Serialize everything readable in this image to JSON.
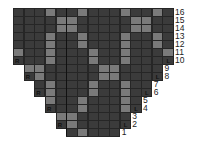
{
  "chart": {
    "columns": 15,
    "colors": {
      "dark": "#3b3b3b",
      "light": "#7a7a7a",
      "grid": "#262626",
      "background": "#ffffff"
    },
    "rows": [
      {
        "label": "16",
        "start": 0,
        "end": 14,
        "light": [
          3,
          6,
          10,
          13
        ],
        "R": null,
        "L": null
      },
      {
        "label": "15",
        "start": 0,
        "end": 14,
        "light": [
          4,
          5,
          11,
          12
        ],
        "R": null,
        "L": null
      },
      {
        "label": "14",
        "start": 0,
        "end": 14,
        "light": [
          4,
          5,
          11,
          12
        ],
        "R": null,
        "L": null
      },
      {
        "label": "13",
        "start": 0,
        "end": 14,
        "light": [
          3,
          6,
          10,
          13
        ],
        "R": null,
        "L": null
      },
      {
        "label": "12",
        "start": 0,
        "end": 14,
        "light": [
          3,
          6,
          10,
          13
        ],
        "R": null,
        "L": null
      },
      {
        "label": "11",
        "start": 0,
        "end": 14,
        "light": [
          0,
          3,
          7,
          10,
          14
        ],
        "R": null,
        "L": null
      },
      {
        "label": "10",
        "start": 0,
        "end": 14,
        "light": [
          3,
          7,
          10
        ],
        "R": 0,
        "L": 14
      },
      {
        "label": "9",
        "start": 1,
        "end": 13,
        "light": [
          1,
          2,
          8,
          9
        ],
        "R": null,
        "L": null
      },
      {
        "label": "8",
        "start": 1,
        "end": 13,
        "light": [
          2,
          8,
          9
        ],
        "R": 1,
        "L": 13
      },
      {
        "label": "7",
        "start": 2,
        "end": 12,
        "light": [
          3,
          7,
          10
        ],
        "R": null,
        "L": null
      },
      {
        "label": "6",
        "start": 2,
        "end": 12,
        "light": [
          3,
          7,
          10
        ],
        "R": 2,
        "L": 12
      },
      {
        "label": "5",
        "start": 3,
        "end": 11,
        "light": [
          3,
          6,
          10
        ],
        "R": null,
        "L": null
      },
      {
        "label": "4",
        "start": 3,
        "end": 11,
        "light": [
          6,
          10
        ],
        "R": 3,
        "L": 11
      },
      {
        "label": "3",
        "start": 4,
        "end": 10,
        "light": [
          4,
          5
        ],
        "R": null,
        "L": null
      },
      {
        "label": "2",
        "start": 4,
        "end": 10,
        "light": [
          5
        ],
        "R": 4,
        "L": 10
      },
      {
        "label": "1",
        "start": 5,
        "end": 9,
        "light": [
          6
        ],
        "R": null,
        "L": null
      }
    ],
    "marks": {
      "right_edge": "R",
      "left_edge": "L"
    }
  }
}
